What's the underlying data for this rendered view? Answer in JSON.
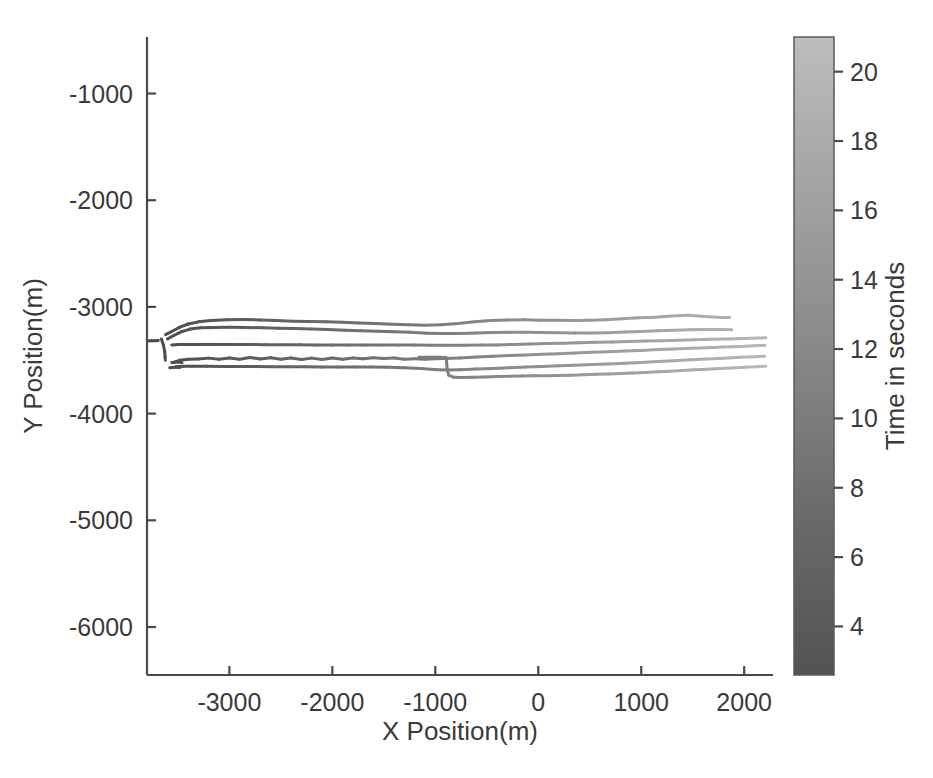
{
  "figure": {
    "width": 933,
    "height": 778,
    "background": "#ffffff",
    "title": ""
  },
  "chart_data": {
    "type": "line",
    "title": "",
    "subtitle": "",
    "xlabel": "X Position(m)",
    "ylabel": "Y Position(m)",
    "xlim": [
      -3800,
      2280
    ],
    "ylim": [
      -6450,
      -470
    ],
    "xticks": [
      -3000,
      -2000,
      -1000,
      0,
      1000,
      2000
    ],
    "xtick_labels": [
      "-3000",
      "-2000",
      "-1000",
      "0",
      "1000",
      "2000"
    ],
    "yticks": [
      -1000,
      -2000,
      -3000,
      -4000,
      -5000,
      -6000
    ],
    "ytick_labels": [
      "-1000",
      "-2000",
      "-3000",
      "-4000",
      "-5000",
      "-6000"
    ],
    "grid": false,
    "legend": null,
    "legend_position": "none",
    "annotations": [],
    "colormap": {
      "name": "grayscale",
      "low_color": "#4a4a4a",
      "high_color": "#b9b9b9",
      "variable": "Time in seconds",
      "vmin": 2.6,
      "vmax": 21.0
    },
    "colorbar": {
      "title": "Time in seconds",
      "orientation": "vertical",
      "position": "right",
      "ticks": [
        20,
        18,
        16,
        14,
        12,
        10,
        8,
        6,
        4
      ],
      "tick_labels": [
        "20",
        "18",
        "16",
        "14",
        "12",
        "10",
        "8",
        "6",
        "4"
      ],
      "vmin": 2.6,
      "vmax": 21.0
    },
    "series": [
      {
        "name": "track-1",
        "comment": "uppermost trajectory, rises slightly and ends near -3100",
        "x": [
          -3620,
          -3560,
          -3480,
          -3400,
          -3300,
          -3180,
          -3020,
          -2860,
          -2700,
          -2540,
          -2380,
          -2220,
          -2060,
          -1900,
          -1740,
          -1580,
          -1420,
          -1260,
          -1100,
          -940,
          -780,
          -620,
          -460,
          -300,
          -140,
          20,
          180,
          340,
          500,
          660,
          820,
          980,
          1140,
          1300,
          1460,
          1620,
          1780,
          1860
        ],
        "y": [
          -3260,
          -3230,
          -3190,
          -3160,
          -3140,
          -3128,
          -3120,
          -3118,
          -3122,
          -3128,
          -3134,
          -3136,
          -3140,
          -3144,
          -3150,
          -3156,
          -3162,
          -3168,
          -3172,
          -3168,
          -3156,
          -3140,
          -3128,
          -3122,
          -3120,
          -3124,
          -3126,
          -3128,
          -3126,
          -3120,
          -3110,
          -3102,
          -3096,
          -3084,
          -3078,
          -3090,
          -3098,
          -3100
        ]
      },
      {
        "name": "track-2",
        "comment": "second trajectory, nearly parallel below track-1",
        "x": [
          -3600,
          -3540,
          -3460,
          -3380,
          -3280,
          -3160,
          -3000,
          -2840,
          -2680,
          -2520,
          -2360,
          -2200,
          -2040,
          -1880,
          -1720,
          -1560,
          -1400,
          -1240,
          -1080,
          -920,
          -760,
          -600,
          -440,
          -280,
          -120,
          40,
          200,
          360,
          520,
          680,
          840,
          1000,
          1160,
          1320,
          1480,
          1640,
          1800,
          1880
        ],
        "y": [
          -3300,
          -3268,
          -3230,
          -3208,
          -3196,
          -3192,
          -3190,
          -3192,
          -3196,
          -3200,
          -3202,
          -3206,
          -3212,
          -3218,
          -3224,
          -3228,
          -3232,
          -3238,
          -3246,
          -3250,
          -3248,
          -3244,
          -3240,
          -3238,
          -3238,
          -3240,
          -3242,
          -3244,
          -3244,
          -3242,
          -3236,
          -3230,
          -3224,
          -3218,
          -3214,
          -3212,
          -3212,
          -3214
        ]
      },
      {
        "name": "track-3",
        "comment": "flat middle trajectory, slowly drifts up at right, with small dash at left start",
        "x": [
          -3560,
          -3490,
          -3400,
          -3280,
          -3120,
          -2960,
          -2800,
          -2640,
          -2480,
          -2320,
          -2160,
          -2000,
          -1840,
          -1680,
          -1520,
          -1360,
          -1200,
          -1040,
          -880,
          -720,
          -560,
          -400,
          -240,
          -80,
          80,
          240,
          400,
          560,
          720,
          880,
          1040,
          1200,
          1360,
          1520,
          1680,
          1840,
          2000,
          2140,
          2210
        ],
        "y": [
          -3356,
          -3352,
          -3352,
          -3352,
          -3352,
          -3352,
          -3352,
          -3354,
          -3354,
          -3354,
          -3356,
          -3356,
          -3356,
          -3356,
          -3358,
          -3358,
          -3358,
          -3360,
          -3360,
          -3360,
          -3358,
          -3356,
          -3352,
          -3348,
          -3344,
          -3340,
          -3336,
          -3332,
          -3328,
          -3324,
          -3320,
          -3316,
          -3312,
          -3308,
          -3304,
          -3300,
          -3296,
          -3292,
          -3290
        ]
      },
      {
        "name": "track-4",
        "comment": "oscillating trajectory, flattens then joins a step at x=-900",
        "x": [
          -3540,
          -3480,
          -3400,
          -3300,
          -3200,
          -3100,
          -3000,
          -2900,
          -2800,
          -2700,
          -2600,
          -2500,
          -2400,
          -2300,
          -2200,
          -2100,
          -2000,
          -1900,
          -1800,
          -1700,
          -1600,
          -1500,
          -1400,
          -1300,
          -1200,
          -1100,
          -1000,
          -900,
          -760,
          -600,
          -440,
          -280,
          -120,
          40,
          200,
          360,
          520,
          680,
          840,
          1000,
          1160,
          1320,
          1480,
          1640,
          1800,
          1960,
          2100,
          2200
        ],
        "y": [
          -3520,
          -3500,
          -3490,
          -3488,
          -3480,
          -3490,
          -3478,
          -3490,
          -3474,
          -3488,
          -3476,
          -3490,
          -3478,
          -3492,
          -3480,
          -3492,
          -3478,
          -3490,
          -3478,
          -3486,
          -3476,
          -3484,
          -3478,
          -3490,
          -3486,
          -3490,
          -3486,
          -3484,
          -3478,
          -3470,
          -3462,
          -3456,
          -3450,
          -3444,
          -3438,
          -3432,
          -3426,
          -3420,
          -3414,
          -3408,
          -3400,
          -3394,
          -3388,
          -3382,
          -3376,
          -3370,
          -3364,
          -3360
        ]
      },
      {
        "name": "track-5",
        "comment": "lower flat trajectory, short dash at left then continuous",
        "x": [
          -3520,
          -3450,
          -3360,
          -3220,
          -3060,
          -2900,
          -2740,
          -2580,
          -2420,
          -2260,
          -2100,
          -1940,
          -1780,
          -1620,
          -1460,
          -1300,
          -1140,
          -980,
          -880,
          -760,
          -600,
          -440,
          -280,
          -120,
          40,
          200,
          360,
          520,
          680,
          840,
          1000,
          1160,
          1320,
          1480,
          1640,
          1800,
          1960,
          2100,
          2200
        ],
        "y": [
          -3560,
          -3556,
          -3556,
          -3556,
          -3558,
          -3558,
          -3558,
          -3560,
          -3560,
          -3560,
          -3562,
          -3562,
          -3562,
          -3564,
          -3566,
          -3570,
          -3578,
          -3588,
          -3592,
          -3588,
          -3582,
          -3576,
          -3570,
          -3564,
          -3558,
          -3552,
          -3546,
          -3540,
          -3534,
          -3528,
          -3520,
          -3512,
          -3504,
          -3496,
          -3488,
          -3480,
          -3472,
          -3466,
          -3462
        ]
      },
      {
        "name": "track-6",
        "comment": "step trajectory: short level segment from x=-1160 then sharp drop at x=-890 and long flat run",
        "x": [
          -1160,
          -1050,
          -950,
          -895,
          -890,
          -885,
          -870,
          -820,
          -740,
          -640,
          -520,
          -400,
          -280,
          -160,
          -40,
          80,
          200,
          320,
          440,
          560,
          680,
          800,
          920,
          1040,
          1160,
          1280,
          1400,
          1520,
          1640,
          1760,
          1880,
          2000,
          2120,
          2210
        ],
        "y": [
          -3472,
          -3472,
          -3472,
          -3474,
          -3520,
          -3580,
          -3640,
          -3660,
          -3662,
          -3660,
          -3656,
          -3652,
          -3650,
          -3648,
          -3646,
          -3644,
          -3642,
          -3640,
          -3636,
          -3632,
          -3628,
          -3624,
          -3620,
          -3614,
          -3608,
          -3602,
          -3596,
          -3590,
          -3584,
          -3578,
          -3572,
          -3566,
          -3560,
          -3556
        ]
      },
      {
        "name": "track-lead-dash-a",
        "comment": "isolated dark dash near left edge, earliest time",
        "x": [
          -3800,
          -3760,
          -3720,
          -3690
        ],
        "y": [
          -3320,
          -3318,
          -3316,
          -3314
        ]
      },
      {
        "name": "track-lead-dash-b",
        "comment": "short dark hook descending at left start",
        "x": [
          -3660,
          -3640,
          -3628,
          -3624,
          -3622
        ],
        "y": [
          -3300,
          -3360,
          -3420,
          -3470,
          -3500
        ]
      },
      {
        "name": "track-lead-dash-c",
        "comment": "short dark dash at left of track-4",
        "x": [
          -3560,
          -3500,
          -3460
        ],
        "y": [
          -3520,
          -3516,
          -3522
        ]
      },
      {
        "name": "track-lead-dash-d",
        "comment": "short dark dash at left of track-5",
        "x": [
          -3580,
          -3520,
          -3480
        ],
        "y": [
          -3570,
          -3566,
          -3568
        ]
      }
    ]
  },
  "axes": {
    "x_axis_title": "X Position(m)",
    "y_axis_title": "Y Position(m)"
  },
  "colorbar_ui": {
    "title": "Time in seconds"
  }
}
